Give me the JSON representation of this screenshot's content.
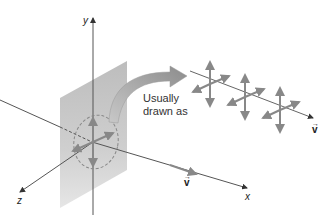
{
  "diagram": {
    "axes": {
      "y_label": "y",
      "x_label": "x",
      "z_label": "z"
    },
    "caption": {
      "line1": "Usually",
      "line2": "drawn as"
    },
    "vector_label_main": "v",
    "vector_label_inset": "v",
    "vector_arrow_glyph": "→",
    "colors": {
      "plane": "#c9c9c9",
      "axis": "#555555",
      "arrows": "#8a8a8a",
      "curved_arrow": "#9a9a9a",
      "text": "#222222"
    }
  }
}
